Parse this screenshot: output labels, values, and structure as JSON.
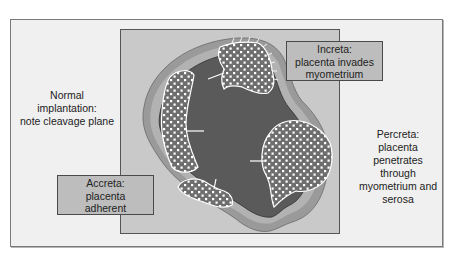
{
  "figure": {
    "colors": {
      "frame_bg": "#f0f0f0",
      "panel_bg": "#c9c9c9",
      "serosa": "#9a9a9a",
      "myometrium": "#b2b2b2",
      "cavity": "#5a5a5a",
      "placenta": "#6e6e6e",
      "placenta_dots": "#ffffff",
      "box_bg": "#bdbdbd"
    },
    "labels": {
      "normal": {
        "lines": [
          "Normal",
          "implantation:",
          "note cleavage plane"
        ]
      },
      "increta": {
        "lines": [
          "Increta:",
          "placenta invades",
          "myometrium"
        ]
      },
      "accreta": {
        "lines": [
          "Accreta:",
          "placenta",
          "adherent"
        ]
      },
      "percreta": {
        "lines": [
          "Percreta:",
          "placenta",
          "penetrates",
          "through",
          "myometrium and",
          "serosa"
        ]
      }
    }
  }
}
